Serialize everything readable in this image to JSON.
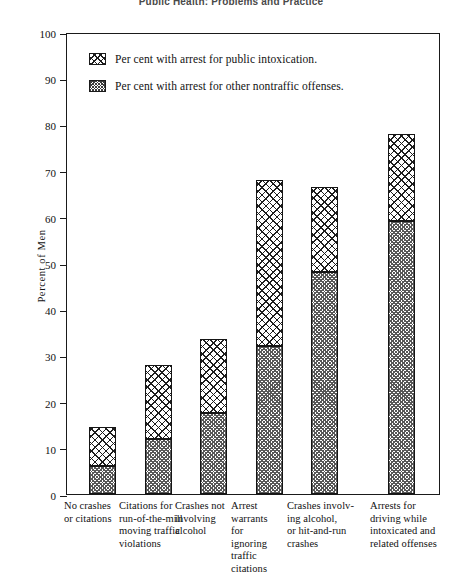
{
  "page_header": "Public Health:  Problems and Practice",
  "legend": {
    "items": [
      {
        "label": "Per cent with arrest for public intoxication.",
        "pattern": "cross-hatch",
        "swatch_name": "legend-swatch-intoxication"
      },
      {
        "label": "Per cent with arrest for other nontraffic offenses.",
        "pattern": "fine-checker",
        "swatch_name": "legend-swatch-nontraffic"
      }
    ]
  },
  "chart_data": {
    "type": "bar",
    "stacked": true,
    "title": "",
    "xlabel": "",
    "ylabel": "Percent of Men",
    "ylim": [
      0,
      100
    ],
    "yticks": [
      0,
      10,
      20,
      30,
      40,
      50,
      60,
      70,
      80,
      90,
      100
    ],
    "ytick_labels": [
      "0",
      "10",
      "20",
      "30",
      "40",
      "50",
      "60",
      "70",
      "80",
      "90",
      "100"
    ],
    "grid": false,
    "legend_position": "upper-left-inside",
    "categories": [
      "No crashes or citations",
      "Citations for run-of-the-mill moving traffic violations",
      "Crashes not involving alcohol",
      "Arrest warrants for ignoring traffic citations",
      "Crashes involving alcohol, or hit-and-run crashes",
      "Arrests for driving while intoxicated and related offenses"
    ],
    "category_lines": [
      [
        "No crashes",
        "or citations"
      ],
      [
        "Citations for",
        "run-of-the-mill",
        "moving traffic",
        "violations"
      ],
      [
        "Crashes not",
        "involving",
        "alcohol"
      ],
      [
        "Arrest",
        "warrants",
        "for",
        "ignoring",
        "traffic",
        "citations"
      ],
      [
        "Crashes involv-",
        "ing alcohol,",
        "or hit-and-run",
        "crashes"
      ],
      [
        "Arrests for",
        "driving while",
        "intoxicated and",
        "related offenses"
      ]
    ],
    "series": [
      {
        "name": "Per cent with arrest for other nontraffic offenses.",
        "pattern": "fine-checker",
        "values": [
          6,
          12,
          17.5,
          32,
          48,
          59
        ]
      },
      {
        "name": "Per cent with arrest for public intoxication.",
        "pattern": "cross-hatch",
        "values": [
          8.5,
          16,
          16,
          36,
          18.5,
          19
        ]
      }
    ],
    "totals": [
      14.5,
      28,
      33.5,
      68,
      66.5,
      78
    ]
  },
  "layout": {
    "plot_left_px": 66,
    "plot_top_px": 33,
    "plot_width_px": 374,
    "plot_height_px": 462,
    "bar_width_px": 27,
    "bar_centers_px": [
      101,
      157,
      212,
      268,
      323,
      400
    ]
  },
  "colors": {
    "frame": "#1a1a1a",
    "hatch": "#1d1d1d",
    "stipple": "#575757",
    "background": "#ffffff",
    "text": "#111111"
  }
}
